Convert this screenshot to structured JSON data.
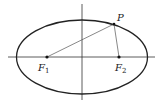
{
  "diagram": {
    "type": "ellipse-with-foci",
    "labels": {
      "point": "P",
      "focus1_letter": "F",
      "focus1_sub": "1",
      "focus2_letter": "F",
      "focus2_sub": "2"
    },
    "colors": {
      "curve": "#222222",
      "axes": "#333333",
      "segments": "#555555",
      "points": "#111111"
    }
  }
}
